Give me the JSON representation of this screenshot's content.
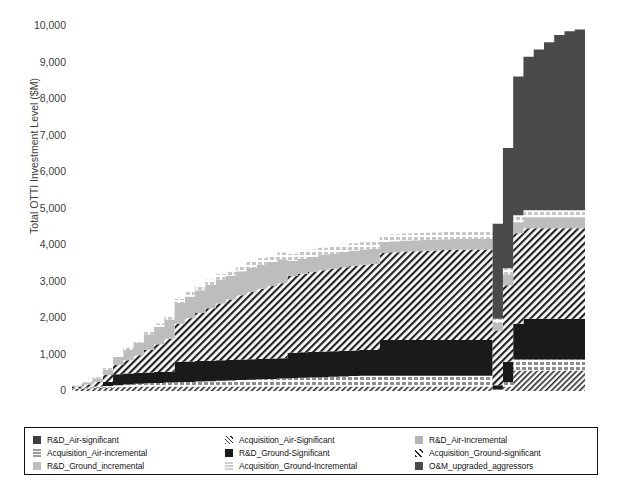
{
  "chart_data": {
    "type": "area",
    "title": "",
    "xlabel": "",
    "ylabel": "Total OTTI Investment Level ($M)",
    "ylim": [
      0,
      10000
    ],
    "yticks": [
      0,
      1000,
      2000,
      3000,
      4000,
      5000,
      6000,
      7000,
      8000,
      9000,
      10000
    ],
    "ytick_labels": [
      "0",
      "1,000",
      "2,000",
      "3,000",
      "4,000",
      "5,000",
      "6,000",
      "7,000",
      "8,000",
      "9,000",
      "10,000"
    ],
    "grid": false,
    "legend_position": "bottom",
    "stacked": true,
    "x": [
      0,
      2,
      4,
      6,
      8,
      10,
      12,
      14,
      16,
      18,
      20,
      22,
      24,
      26,
      28,
      30,
      32,
      34,
      36,
      38,
      40,
      42,
      44,
      46,
      48,
      50,
      52,
      54,
      56,
      58,
      60,
      62,
      64,
      66,
      68,
      70,
      72,
      74,
      76,
      78,
      80,
      82,
      84,
      86,
      88,
      90,
      92,
      94,
      96,
      98,
      100
    ],
    "series": [
      {
        "name": "R&D_Air-significant",
        "color": "#3f3f3f",
        "pattern": "solid",
        "values": [
          0,
          0,
          0,
          0,
          0,
          0,
          0,
          0,
          0,
          0,
          0,
          0,
          0,
          0,
          0,
          0,
          0,
          0,
          0,
          0,
          0,
          0,
          0,
          0,
          0,
          0,
          0,
          0,
          0,
          0,
          0,
          0,
          0,
          0,
          0,
          0,
          0,
          0,
          0,
          0,
          0,
          0,
          0,
          0,
          0,
          0,
          0,
          0,
          0,
          0,
          0
        ]
      },
      {
        "name": "Acquisition_Air-Significant",
        "color": "#2b2b2b",
        "pattern": "diag-thin",
        "values": [
          60,
          70,
          80,
          90,
          100,
          110,
          120,
          120,
          120,
          120,
          120,
          120,
          120,
          120,
          120,
          120,
          120,
          120,
          120,
          120,
          120,
          120,
          120,
          120,
          120,
          120,
          120,
          120,
          120,
          120,
          120,
          120,
          120,
          120,
          120,
          120,
          120,
          120,
          120,
          120,
          120,
          10,
          120,
          560,
          560,
          560,
          560,
          560,
          560,
          560,
          560
        ]
      },
      {
        "name": "R&D_Air-Incremental",
        "color": "#b4b4b4",
        "pattern": "solid",
        "values": [
          0,
          0,
          0,
          0,
          0,
          0,
          0,
          0,
          0,
          0,
          0,
          0,
          0,
          0,
          0,
          0,
          0,
          0,
          0,
          0,
          0,
          0,
          0,
          0,
          0,
          0,
          0,
          0,
          0,
          0,
          0,
          0,
          0,
          0,
          0,
          0,
          0,
          0,
          0,
          0,
          0,
          0,
          0,
          0,
          0,
          0,
          0,
          0,
          0,
          0,
          0
        ]
      },
      {
        "name": "Acquisition_Air-incremental",
        "color": "#9a9a9a",
        "pattern": "dash-row",
        "values": [
          20,
          30,
          40,
          50,
          60,
          70,
          80,
          90,
          100,
          110,
          120,
          130,
          140,
          150,
          160,
          170,
          180,
          190,
          200,
          210,
          220,
          230,
          240,
          250,
          260,
          270,
          280,
          290,
          300,
          300,
          300,
          300,
          300,
          300,
          300,
          300,
          300,
          300,
          300,
          300,
          300,
          30,
          120,
          300,
          300,
          300,
          300,
          300,
          300,
          300,
          300
        ]
      },
      {
        "name": "R&D_Ground-Significant",
        "color": "#1a1a1a",
        "pattern": "solid",
        "values": [
          0,
          0,
          0,
          110,
          300,
          300,
          300,
          300,
          300,
          300,
          560,
          560,
          560,
          560,
          560,
          560,
          560,
          560,
          560,
          560,
          560,
          700,
          700,
          700,
          700,
          700,
          700,
          700,
          700,
          700,
          980,
          980,
          980,
          980,
          980,
          980,
          980,
          980,
          980,
          980,
          980,
          120,
          560,
          980,
          1120,
          1120,
          1120,
          1120,
          1120,
          1120,
          1120
        ]
      },
      {
        "name": "Acquisition_Ground-significant",
        "color": "#242424",
        "pattern": "diag-wide",
        "values": [
          40,
          80,
          130,
          190,
          260,
          360,
          480,
          620,
          760,
          900,
          1040,
          1180,
          1320,
          1440,
          1560,
          1660,
          1760,
          1840,
          1920,
          1990,
          2050,
          2100,
          2150,
          2190,
          2230,
          2260,
          2290,
          2320,
          2340,
          2360,
          2380,
          2400,
          2420,
          2430,
          2440,
          2450,
          2460,
          2470,
          2470,
          2480,
          2480,
          1500,
          2100,
          2480,
          2480,
          2480,
          2480,
          2480,
          2480,
          2480,
          2480
        ]
      },
      {
        "name": "R&D_Ground_incremental",
        "color": "#bdbdbd",
        "pattern": "solid",
        "values": [
          30,
          60,
          100,
          150,
          210,
          280,
          350,
          420,
          480,
          530,
          570,
          600,
          620,
          640,
          650,
          655,
          660,
          660,
          660,
          660,
          660,
          420,
          420,
          420,
          420,
          420,
          420,
          420,
          420,
          420,
          300,
          300,
          300,
          300,
          300,
          300,
          300,
          300,
          300,
          300,
          300,
          200,
          300,
          300,
          300,
          300,
          300,
          300,
          300,
          300,
          300
        ]
      },
      {
        "name": "Acquisition_Ground-Incremental",
        "color": "#cfcfcf",
        "pattern": "dash-row",
        "values": [
          10,
          20,
          30,
          40,
          50,
          60,
          70,
          80,
          90,
          100,
          110,
          120,
          130,
          140,
          150,
          160,
          165,
          170,
          175,
          180,
          185,
          190,
          195,
          195,
          195,
          195,
          195,
          195,
          195,
          195,
          195,
          195,
          195,
          195,
          195,
          195,
          195,
          195,
          195,
          195,
          195,
          120,
          160,
          195,
          195,
          195,
          195,
          195,
          195,
          195,
          195
        ]
      },
      {
        "name": "O&M_upgraded_aggressors",
        "color": "#4a4a4a",
        "pattern": "solid",
        "values": [
          0,
          0,
          0,
          0,
          0,
          0,
          0,
          0,
          0,
          0,
          0,
          0,
          0,
          0,
          0,
          0,
          0,
          0,
          0,
          0,
          0,
          0,
          0,
          0,
          0,
          0,
          0,
          0,
          0,
          0,
          0,
          0,
          0,
          0,
          0,
          0,
          0,
          0,
          0,
          0,
          0,
          2600,
          3300,
          3800,
          4200,
          4400,
          4600,
          4800,
          4900,
          4950,
          5000
        ]
      }
    ]
  },
  "legend": {
    "items": [
      {
        "label": "R&D_Air-significant",
        "swatch": "solid-dark",
        "color": "#3f3f3f"
      },
      {
        "label": "Acquisition_Air-Significant",
        "swatch": "diag-thin",
        "color": "#2b2b2b"
      },
      {
        "label": "R&D_Air-Incremental",
        "swatch": "solid-light",
        "color": "#b4b4b4"
      },
      {
        "label": "Acquisition_Air-incremental",
        "swatch": "dash-light",
        "color": "#9a9a9a"
      },
      {
        "label": "R&D_Ground-Significant",
        "swatch": "solid-black",
        "color": "#1a1a1a"
      },
      {
        "label": "Acquisition_Ground-significant",
        "swatch": "diag-wide",
        "color": "#242424"
      },
      {
        "label": "R&D_Ground_incremental",
        "swatch": "solid-grey",
        "color": "#bdbdbd"
      },
      {
        "label": "Acquisition_Ground-Incremental",
        "swatch": "dash-grey",
        "color": "#cfcfcf"
      },
      {
        "label": "O&M_upgraded_aggressors",
        "swatch": "solid-mid",
        "color": "#4a4a4a"
      }
    ]
  }
}
